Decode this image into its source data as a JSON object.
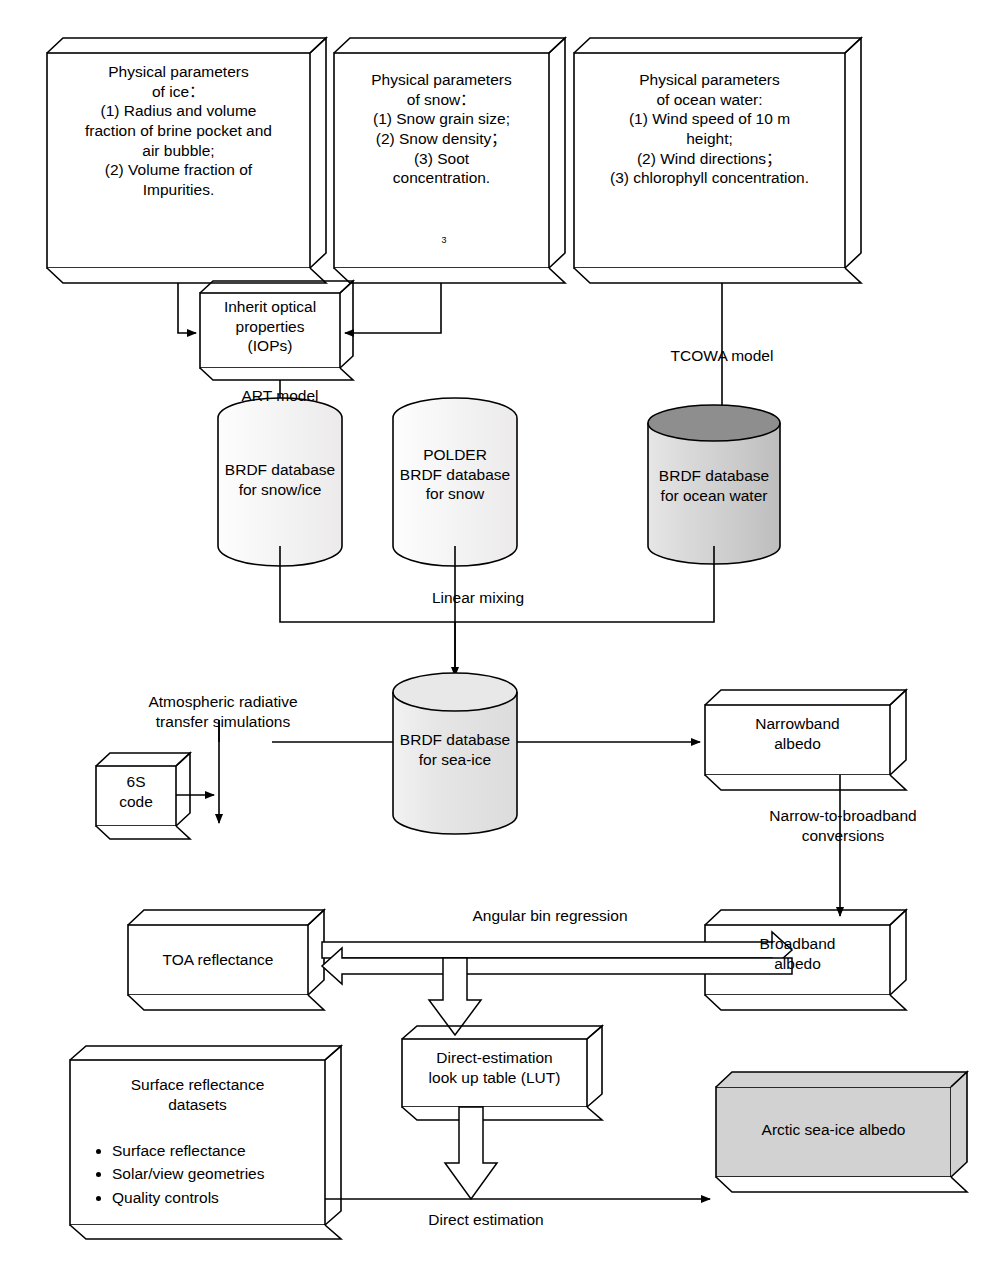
{
  "diagram": {
    "colors": {
      "stroke": "#000000",
      "box_fill": "#ffffff",
      "cylinder_light": "#ebebeb",
      "cylinder_mid": "#d6d6d6",
      "cylinder_dark": "#8c8c8c",
      "result_fill": "#d0d0d0"
    }
  },
  "nodes": {
    "ice_params": {
      "label": "Physical parameters\nof ice：\n(1) Radius and volume\nfraction of brine pocket and\nair bubble;\n(2) Volume fraction of\nImpurities."
    },
    "snow_params": {
      "label": "Physical parameters\nof snow：\n(1) Snow grain size;\n(2) Snow density；\n(3) Soot\nconcentration.",
      "footnote": "3"
    },
    "ocean_params": {
      "label": "Physical parameters\nof ocean water:\n(1) Wind speed of 10 m\nheight;\n(2) Wind directions；\n(3) chlorophyll concentration."
    },
    "iops": {
      "label": "Inherit optical\nproperties\n(IOPs)"
    },
    "db_snow_ice": {
      "label": "BRDF database\nfor snow/ice"
    },
    "db_polder": {
      "label": "POLDER\nBRDF database\nfor snow"
    },
    "db_ocean": {
      "label": "BRDF database\nfor ocean water"
    },
    "db_sea_ice": {
      "label": "BRDF database\nfor sea-ice"
    },
    "sixs": {
      "label": "6S\ncode"
    },
    "toa": {
      "label": "TOA reflectance"
    },
    "narrowband": {
      "label": "Narrowband\nalbedo"
    },
    "broadband": {
      "label": "Broadband\nalbedo"
    },
    "lut": {
      "label": "Direct-estimation\nlook up table (LUT)"
    },
    "surface_datasets": {
      "title": "Surface reflectance\ndatasets",
      "items": [
        "Surface reflectance",
        "Solar/view geometries",
        "Quality controls"
      ]
    },
    "result": {
      "label": "Arctic sea-ice albedo"
    }
  },
  "edge_labels": {
    "tcowa": "TCOWA model",
    "art": "ART model",
    "linear_mixing": "Linear mixing",
    "atmospheric": "Atmospheric radiative\ntransfer simulations",
    "narrow_to_broad": "Narrow-to-broadband\nconversions",
    "angular_bin": "Angular bin regression",
    "direct_estimation": "Direct estimation"
  }
}
